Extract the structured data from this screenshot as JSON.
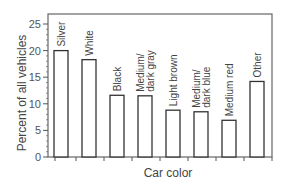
{
  "chart_data": {
    "type": "bar",
    "title": "",
    "xlabel": "Car color",
    "ylabel": "Percent of all vehicles",
    "ylim": [
      0,
      27
    ],
    "yticks": [
      0,
      5,
      10,
      15,
      20,
      25
    ],
    "grid": false,
    "legend": null,
    "categories": [
      [
        "Silver"
      ],
      [
        "White"
      ],
      [
        "Black"
      ],
      [
        "Medium/",
        "dark gray"
      ],
      [
        "Light brown"
      ],
      [
        "Medium/",
        "dark blue"
      ],
      [
        "Medium red"
      ],
      [
        "Other"
      ]
    ],
    "category_names": [
      "Silver",
      "White",
      "Black",
      "Medium/dark gray",
      "Light brown",
      "Medium/dark blue",
      "Medium red",
      "Other"
    ],
    "values": [
      20.0,
      18.3,
      11.6,
      11.5,
      8.8,
      8.5,
      6.9,
      14.2
    ]
  },
  "colors": {
    "bar_fill": "#ffffff",
    "bar_stroke": "#333333",
    "axis": "#555555"
  }
}
